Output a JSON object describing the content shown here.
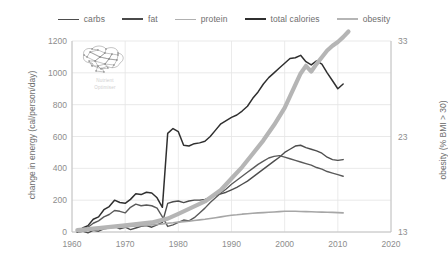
{
  "chart_data": {
    "type": "line",
    "title": "",
    "xlabel": "",
    "ylabel": "change in energy (cal/person/day)",
    "y2label": "obesity (% BMI > 30)",
    "xlim": [
      1960,
      2020
    ],
    "ylim": [
      0,
      1200
    ],
    "y2lim": [
      13,
      33
    ],
    "xticks": [
      "1960",
      "1970",
      "1980",
      "1990",
      "2000",
      "2010",
      "2020"
    ],
    "yticks": [
      "0",
      "200",
      "400",
      "600",
      "800",
      "1000",
      "1200"
    ],
    "y2ticks": [
      "13",
      "23",
      "33"
    ],
    "grid": true,
    "legend_position": "top-center",
    "series": [
      {
        "name": "carbs",
        "axis": "left",
        "color": "#4d4d4d",
        "width": 1.4,
        "x": [
          1961,
          1962,
          1963,
          1964,
          1965,
          1966,
          1967,
          1968,
          1969,
          1970,
          1971,
          1972,
          1973,
          1974,
          1975,
          1976,
          1977,
          1978,
          1979,
          1980,
          1981,
          1982,
          1983,
          1984,
          1985,
          1986,
          1987,
          1988,
          1989,
          1990,
          1991,
          1992,
          1993,
          1994,
          1995,
          1996,
          1997,
          1998,
          1999,
          2000,
          2001,
          2002,
          2003,
          2004,
          2005,
          2006,
          2007,
          2008,
          2009,
          2010,
          2011
        ],
        "values": [
          0,
          5,
          -5,
          10,
          5,
          20,
          25,
          35,
          20,
          30,
          15,
          25,
          35,
          40,
          30,
          45,
          60,
          180,
          190,
          195,
          185,
          195,
          200,
          200,
          205,
          215,
          230,
          240,
          250,
          265,
          280,
          300,
          320,
          345,
          370,
          395,
          420,
          445,
          470,
          500,
          520,
          540,
          545,
          530,
          520,
          510,
          495,
          470,
          455,
          450,
          455
        ]
      },
      {
        "name": "fat",
        "axis": "left",
        "color": "#5a5a5a",
        "width": 1.4,
        "x": [
          1961,
          1962,
          1963,
          1964,
          1965,
          1966,
          1967,
          1968,
          1969,
          1970,
          1971,
          1972,
          1973,
          1974,
          1975,
          1976,
          1977,
          1978,
          1979,
          1980,
          1981,
          1982,
          1983,
          1984,
          1985,
          1986,
          1987,
          1988,
          1989,
          1990,
          1991,
          1992,
          1993,
          1994,
          1995,
          1996,
          1997,
          1998,
          1999,
          2000,
          2001,
          2002,
          2003,
          2004,
          2005,
          2006,
          2007,
          2008,
          2009,
          2010,
          2011
        ],
        "values": [
          0,
          20,
          30,
          55,
          70,
          95,
          110,
          135,
          130,
          120,
          155,
          175,
          165,
          170,
          165,
          150,
          95,
          35,
          45,
          60,
          75,
          70,
          90,
          120,
          150,
          185,
          215,
          245,
          270,
          300,
          325,
          350,
          375,
          400,
          425,
          445,
          465,
          475,
          480,
          470,
          460,
          450,
          440,
          430,
          420,
          405,
          395,
          380,
          370,
          360,
          350
        ]
      },
      {
        "name": "protein",
        "axis": "left",
        "color": "#a6a6a6",
        "width": 1.6,
        "x": [
          1961,
          1962,
          1963,
          1964,
          1965,
          1966,
          1967,
          1968,
          1969,
          1970,
          1971,
          1972,
          1973,
          1974,
          1975,
          1976,
          1977,
          1978,
          1979,
          1980,
          1981,
          1982,
          1983,
          1984,
          1985,
          1986,
          1987,
          1988,
          1989,
          1990,
          1991,
          1992,
          1993,
          1994,
          1995,
          1996,
          1997,
          1998,
          1999,
          2000,
          2001,
          2002,
          2003,
          2004,
          2005,
          2006,
          2007,
          2008,
          2009,
          2010,
          2011
        ],
        "values": [
          0,
          5,
          10,
          15,
          18,
          22,
          25,
          28,
          30,
          32,
          35,
          38,
          40,
          42,
          45,
          48,
          50,
          55,
          58,
          62,
          65,
          68,
          72,
          76,
          80,
          85,
          90,
          95,
          100,
          105,
          108,
          112,
          115,
          118,
          120,
          122,
          124,
          126,
          128,
          130,
          130,
          130,
          129,
          128,
          127,
          126,
          125,
          124,
          123,
          122,
          120
        ]
      },
      {
        "name": "total calories",
        "axis": "left",
        "color": "#2f2f2f",
        "width": 1.5,
        "x": [
          1961,
          1962,
          1963,
          1964,
          1965,
          1966,
          1967,
          1968,
          1969,
          1970,
          1971,
          1972,
          1973,
          1974,
          1975,
          1976,
          1977,
          1978,
          1979,
          1980,
          1981,
          1982,
          1983,
          1984,
          1985,
          1986,
          1987,
          1988,
          1989,
          1990,
          1991,
          1992,
          1993,
          1994,
          1995,
          1996,
          1997,
          1998,
          1999,
          2000,
          2001,
          2002,
          2003,
          2004,
          2005,
          2006,
          2007,
          2008,
          2009,
          2010,
          2011
        ],
        "values": [
          0,
          25,
          40,
          80,
          95,
          140,
          160,
          200,
          185,
          180,
          205,
          240,
          235,
          250,
          245,
          215,
          155,
          620,
          650,
          630,
          545,
          540,
          555,
          560,
          570,
          600,
          640,
          680,
          700,
          720,
          735,
          760,
          790,
          840,
          880,
          930,
          970,
          1000,
          1030,
          1060,
          1090,
          1095,
          1110,
          1070,
          1050,
          1075,
          1055,
          1000,
          950,
          900,
          930
        ]
      },
      {
        "name": "obesity",
        "axis": "right",
        "color": "#b5b5b5",
        "width": 4.2,
        "x": [
          1961,
          1965,
          1970,
          1975,
          1978,
          1980,
          1985,
          1988,
          1990,
          1992,
          1994,
          1996,
          1998,
          2000,
          2001,
          2002,
          2003,
          2004,
          2005,
          2006,
          2007,
          2008,
          2009,
          2010,
          2011,
          2012
        ],
        "values": [
          13.2,
          13.4,
          13.7,
          14.0,
          14.4,
          14.9,
          16.2,
          17.4,
          18.6,
          19.8,
          21.2,
          22.6,
          24.2,
          26.0,
          27.2,
          28.4,
          29.6,
          30.4,
          29.8,
          30.6,
          31.3,
          32.0,
          32.5,
          32.9,
          33.4,
          34.0
        ]
      }
    ]
  },
  "legend": {
    "items": [
      {
        "label": "carbs",
        "color": "#4d4d4d",
        "width": 1.8
      },
      {
        "label": "fat",
        "color": "#4a4a4a",
        "width": 2.0
      },
      {
        "label": "protein",
        "color": "#b0b0b0",
        "width": 1.6
      },
      {
        "label": "total calories",
        "color": "#2f2f2f",
        "width": 2.2
      },
      {
        "label": "obesity",
        "color": "#b5b5b5",
        "width": 2.6
      }
    ]
  },
  "watermark": {
    "line1": "Nutrient",
    "line2": "Optimiser"
  }
}
